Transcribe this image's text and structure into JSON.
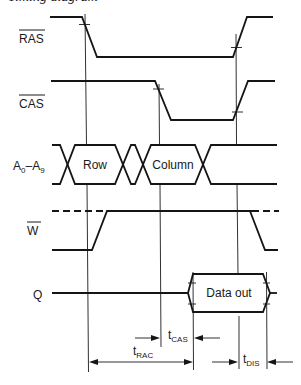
{
  "title": "Timing diagram",
  "signals": {
    "ras": {
      "label": "RAS",
      "active_low": true
    },
    "cas": {
      "label": "CAS",
      "active_low": true
    },
    "address": {
      "label_start": "A",
      "sub_start": "0",
      "separator": "–",
      "label_end": "A",
      "sub_end": "9",
      "fields": {
        "row": "Row",
        "column": "Column"
      }
    },
    "write": {
      "label": "W",
      "active_low": true
    },
    "output": {
      "label": "Q",
      "fields": {
        "data": "Data out"
      }
    }
  },
  "timing": {
    "t_rac": {
      "symbol": "t",
      "sub": "RAC"
    },
    "t_cas": {
      "symbol": "t",
      "sub": "CAS"
    },
    "t_dis": {
      "symbol": "t",
      "sub": "DIS"
    }
  },
  "colors": {
    "line": "#151515",
    "background": "#ffffff"
  }
}
